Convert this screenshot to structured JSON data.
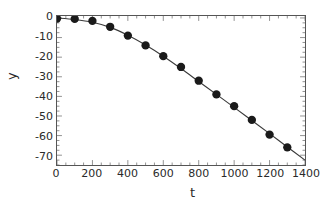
{
  "chart_data": {
    "type": "scatter",
    "title": "",
    "subtitle": "",
    "xlabel": "t",
    "ylabel": "y",
    "xlim": [
      0,
      1400
    ],
    "ylim": [
      -75,
      1
    ],
    "xticks": [
      0,
      200,
      400,
      600,
      800,
      1000,
      1200,
      1400
    ],
    "xticklabels": [
      "0",
      "200",
      "400",
      "600",
      "800",
      "1000",
      "1200",
      "1400"
    ],
    "yticks": [
      0,
      -10,
      -20,
      -30,
      -40,
      -50,
      -60,
      -70
    ],
    "yticklabels": [
      "0",
      "-10",
      "-20",
      "-30",
      "-40",
      "-50",
      "-60",
      "-70"
    ],
    "grid": false,
    "legend": null,
    "marker": "filled-circle",
    "marker_color": "#1a1a1a",
    "line_color": "#3a3a3a",
    "series": [
      {
        "name": "data points",
        "style": "markers",
        "x": [
          0,
          100,
          200,
          300,
          400,
          500,
          600,
          700,
          800,
          900,
          1000,
          1100,
          1200,
          1300
        ],
        "values": [
          -0.3,
          -0.5,
          -1.5,
          -4.5,
          -9.0,
          -14.0,
          -19.5,
          -25.0,
          -32.0,
          -39.0,
          -45.0,
          -52.0,
          -59.5,
          -66.0
        ]
      },
      {
        "name": "fitted curve",
        "style": "line",
        "x": [
          0,
          100,
          200,
          300,
          400,
          500,
          600,
          700,
          800,
          900,
          1000,
          1100,
          1200,
          1300,
          1400
        ],
        "values": [
          0.0,
          -0.8,
          -2.2,
          -4.8,
          -8.8,
          -13.8,
          -19.5,
          -25.8,
          -32.4,
          -39.0,
          -45.6,
          -52.3,
          -59.0,
          -65.8,
          -72.5
        ]
      }
    ]
  },
  "axis": {
    "x_title": "t",
    "y_title": "y"
  },
  "colors": {
    "frame": "#555555",
    "marker": "#1a1a1a",
    "line": "#3a3a3a",
    "text": "#2a2a2a",
    "background": "#ffffff"
  }
}
